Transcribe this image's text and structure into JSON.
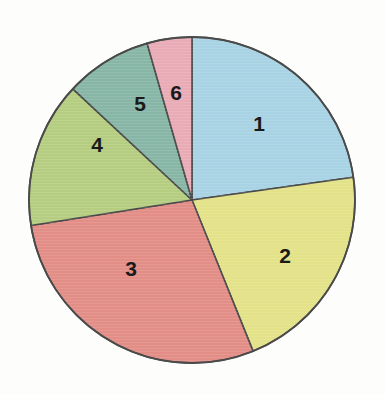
{
  "chart_data": {
    "type": "pie",
    "title": "",
    "subtitle": "",
    "xlabel": "",
    "ylabel": "",
    "legend_position": "none",
    "grid": false,
    "labels_inside": true,
    "start_angle_deg": 0,
    "direction": "clockwise",
    "center": {
      "x": 192,
      "y": 200
    },
    "radius": 163,
    "categories": [
      "1",
      "2",
      "3",
      "4",
      "5",
      "6"
    ],
    "values": [
      82,
      76,
      103,
      52,
      31,
      16
    ],
    "units": "degrees",
    "percentages": [
      22.8,
      21.1,
      28.6,
      14.4,
      8.6,
      4.4
    ],
    "colors": [
      "#a8d3e4",
      "#e3e288",
      "#e28d86",
      "#b4cd80",
      "#87b6a6",
      "#e9abb5"
    ],
    "slices": [
      {
        "label": "1",
        "value": 82,
        "percent": 22.8,
        "color": "#a8d3e4",
        "color_name": "light-blue",
        "start_deg": 0,
        "end_deg": 82,
        "label_x": 259,
        "label_y": 123
      },
      {
        "label": "2",
        "value": 76,
        "percent": 21.1,
        "color": "#e3e288",
        "color_name": "yellow",
        "start_deg": 82,
        "end_deg": 158,
        "label_x": 285,
        "label_y": 255
      },
      {
        "label": "3",
        "value": 103,
        "percent": 28.6,
        "color": "#e28d86",
        "color_name": "salmon-red",
        "start_deg": 158,
        "end_deg": 261,
        "label_x": 131,
        "label_y": 268
      },
      {
        "label": "4",
        "value": 52,
        "percent": 14.4,
        "color": "#b4cd80",
        "color_name": "yellow-green",
        "start_deg": 261,
        "end_deg": 313,
        "label_x": 97,
        "label_y": 144
      },
      {
        "label": "5",
        "value": 31,
        "percent": 8.6,
        "color": "#87b6a6",
        "color_name": "teal-green",
        "start_deg": 313,
        "end_deg": 344,
        "label_x": 140,
        "label_y": 103
      },
      {
        "label": "6",
        "value": 16,
        "percent": 4.4,
        "color": "#e9abb5",
        "color_name": "pink",
        "start_deg": 344,
        "end_deg": 360,
        "label_x": 176,
        "label_y": 92
      }
    ],
    "outline_color": "#4a4a4a",
    "background_color": "#fdfdfb"
  }
}
